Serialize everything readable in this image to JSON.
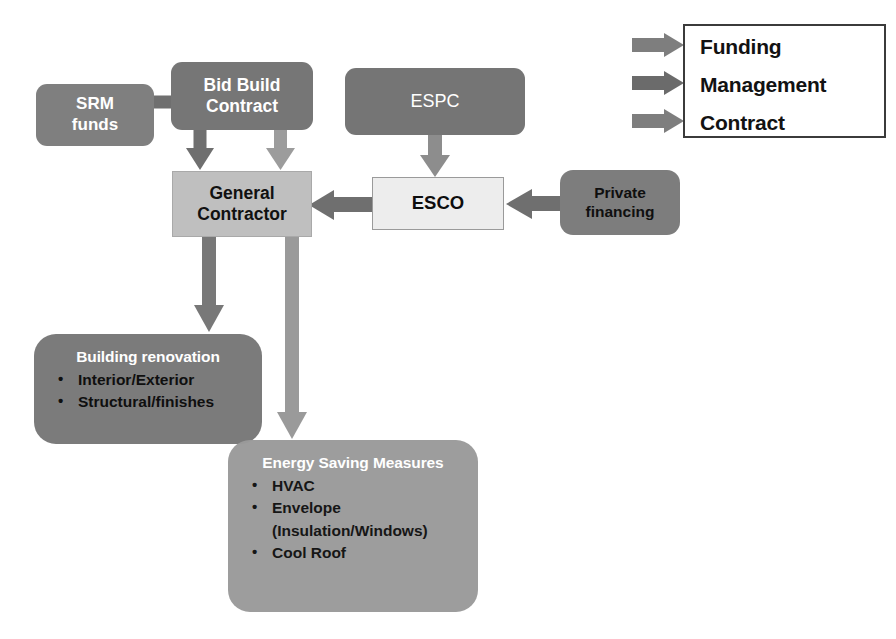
{
  "diagram": {
    "background": "#ffffff",
    "colors": {
      "dark_gray": "#7b7b7b",
      "mid_gray": "#9a9a9a",
      "light_gray": "#bfbfbf",
      "very_light_gray": "#ededed",
      "arrow_dark": "#6e6e6e",
      "arrow_light": "#949494",
      "text_white": "#ffffff",
      "text_black": "#0f0f0f",
      "legend_border": "#3b3b3b"
    }
  },
  "nodes": {
    "srm_funds": {
      "lines": [
        "SRM",
        "funds"
      ]
    },
    "bid_build_contract": {
      "lines": [
        "Bid Build",
        "Contract"
      ]
    },
    "espc": {
      "lines": [
        "ESPC"
      ]
    },
    "general_contractor": {
      "lines": [
        "General",
        "Contractor"
      ]
    },
    "esco": {
      "lines": [
        "ESCO"
      ]
    },
    "private_financing": {
      "lines": [
        "Private",
        "financing"
      ]
    },
    "building_renovation": {
      "title": "Building renovation",
      "bullets": [
        "Interior/Exterior",
        "Structural/finishes"
      ]
    },
    "energy_saving_measures": {
      "title": "Energy Saving Measures",
      "bullets": [
        "HVAC",
        "Envelope",
        "(Insulation/Windows)",
        "Cool Roof"
      ]
    }
  },
  "legend": {
    "items": [
      {
        "label": "Funding",
        "arrow_color": "#7e7e7e"
      },
      {
        "label": "Management",
        "arrow_color": "#6b6b6b"
      },
      {
        "label": "Contract",
        "arrow_color": "#7e7e7e"
      }
    ]
  },
  "connections": [
    {
      "from": "srm_funds",
      "to": "bid_build_contract",
      "kind": "elbow-down-into-general-contractor"
    },
    {
      "from": "bid_build_contract",
      "to": "general_contractor",
      "kind": "down"
    },
    {
      "from": "espc",
      "to": "esco",
      "kind": "down"
    },
    {
      "from": "private_financing",
      "to": "esco",
      "kind": "left"
    },
    {
      "from": "esco",
      "to": "general_contractor",
      "kind": "left"
    },
    {
      "from": "general_contractor",
      "to": "building_renovation",
      "kind": "down"
    },
    {
      "from": "general_contractor",
      "to": "energy_saving_measures",
      "kind": "down"
    }
  ]
}
